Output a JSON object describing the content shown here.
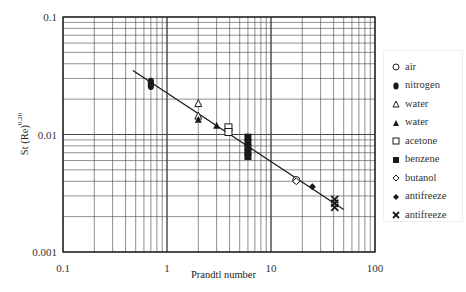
{
  "chart_data": {
    "type": "scatter",
    "title": "",
    "xlabel": "Prandtl number",
    "ylabel": "St (Re)^0.20",
    "ylabel_base": "St (Re)",
    "ylabel_exp": "0.20",
    "xscale": "log",
    "yscale": "log",
    "xlim": [
      0.1,
      100
    ],
    "ylim": [
      0.001,
      0.1
    ],
    "x_ticks": [
      "0.1",
      "1",
      "10",
      "100"
    ],
    "y_ticks": [
      "0.1",
      "0.01",
      "0.001"
    ],
    "grid": true,
    "legend_position": "right",
    "series": [
      {
        "name": "air",
        "marker": "circle-open",
        "points": [
          [
            17.5,
            0.0041
          ]
        ]
      },
      {
        "name": "nitrogen",
        "marker": "circle-filled",
        "points": [
          [
            0.7,
            0.028
          ],
          [
            0.7,
            0.026
          ]
        ]
      },
      {
        "name": "water",
        "marker": "triangle-open",
        "points": [
          [
            2.0,
            0.0185
          ],
          [
            2.0,
            0.0145
          ]
        ]
      },
      {
        "name": "water",
        "marker": "triangle-filled",
        "points": [
          [
            2.0,
            0.0135
          ],
          [
            3.0,
            0.012
          ]
        ]
      },
      {
        "name": "acetone",
        "marker": "square-open",
        "points": [
          [
            3.9,
            0.0115
          ],
          [
            3.9,
            0.0105
          ]
        ]
      },
      {
        "name": "benzene",
        "marker": "square-filled",
        "points": [
          [
            6.0,
            0.0095
          ],
          [
            6.0,
            0.0085
          ],
          [
            6.0,
            0.0078
          ],
          [
            6.0,
            0.0071
          ],
          [
            6.0,
            0.0065
          ]
        ]
      },
      {
        "name": "butanol",
        "marker": "diamond-open",
        "points": [
          [
            17.5,
            0.004
          ]
        ]
      },
      {
        "name": "antifreeze",
        "marker": "diamond-filled",
        "points": [
          [
            25.0,
            0.0036
          ]
        ]
      },
      {
        "name": "antifreeze",
        "marker": "x-cross",
        "points": [
          [
            41.0,
            0.0028
          ],
          [
            41.0,
            0.0026
          ],
          [
            41.0,
            0.0024
          ]
        ]
      }
    ],
    "fit_line": {
      "x": [
        0.47,
        50
      ],
      "y": [
        0.035,
        0.0023
      ]
    }
  },
  "legend": {
    "items": [
      {
        "label": "air",
        "marker": "circle-open"
      },
      {
        "label": "nitrogen",
        "marker": "circle-filled"
      },
      {
        "label": "water",
        "marker": "triangle-open"
      },
      {
        "label": "water",
        "marker": "triangle-filled"
      },
      {
        "label": "acetone",
        "marker": "square-open"
      },
      {
        "label": "benzene",
        "marker": "square-filled"
      },
      {
        "label": "butanol",
        "marker": "diamond-open"
      },
      {
        "label": "antifreeze",
        "marker": "diamond-filled"
      },
      {
        "label": "antifreeze",
        "marker": "x-cross"
      }
    ]
  },
  "colors": {
    "ink": "#1a1a1a",
    "grid": "#444444",
    "background": "#ffffff"
  }
}
